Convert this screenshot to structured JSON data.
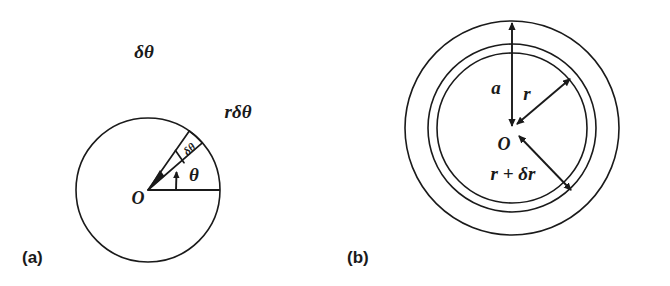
{
  "figure": {
    "background_color": "#ffffff",
    "ink_color": "#1a1a1a",
    "panels": [
      {
        "id": "a",
        "label": "(a)",
        "description": "circle-with-angular-element",
        "labels": {
          "floating_delta_theta": "δθ",
          "arc_length": "rδθ",
          "wedge_angle": "δθ",
          "polar_angle": "θ",
          "origin": "O"
        },
        "geometry": {
          "center_x": 148,
          "center_y": 190,
          "radius": 72,
          "wedge_start_deg": 41,
          "wedge_end_deg": 55,
          "theta_arrow_deg": 48
        }
      },
      {
        "id": "b",
        "label": "(b)",
        "description": "concentric-circles-annulus",
        "labels": {
          "outer_radius": "a",
          "inner_radius": "r",
          "outer_annulus_radius": "r + δr",
          "origin": "O"
        },
        "geometry": {
          "center_x": 177,
          "center_y": 128,
          "radius_a": 107,
          "radius_r": 75,
          "radius_r_plus_dr": 84
        }
      }
    ]
  }
}
